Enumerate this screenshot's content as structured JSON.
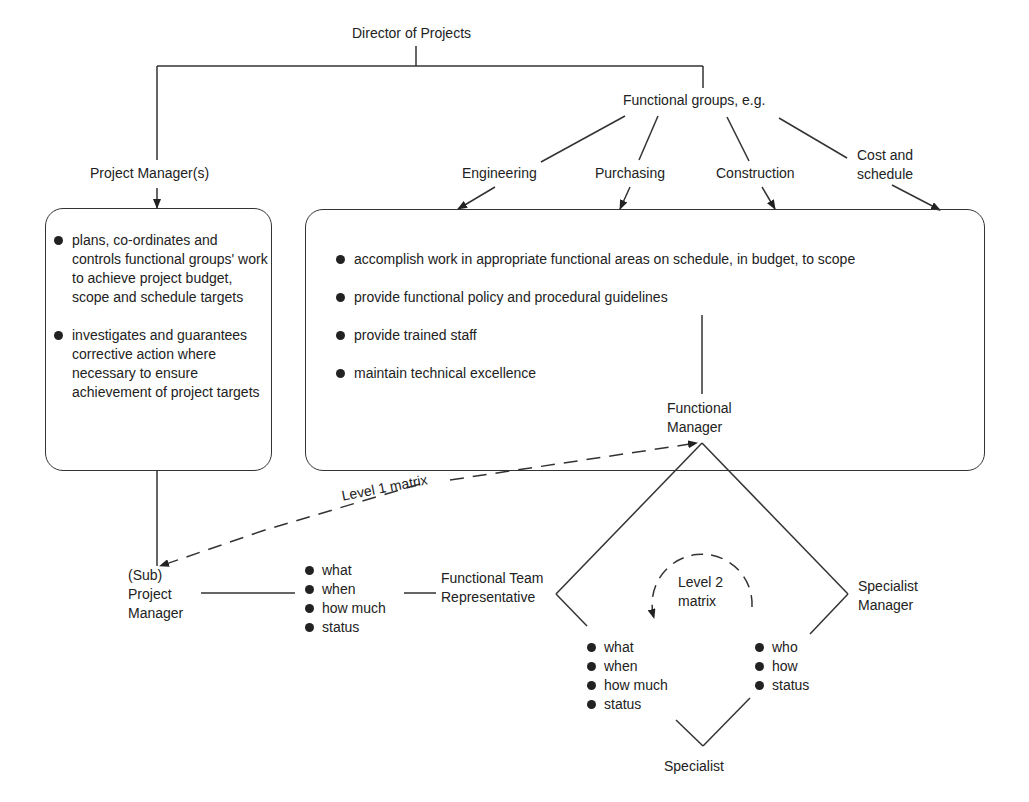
{
  "nodes": {
    "director": "Director of Projects",
    "project_managers": "Project Manager(s)",
    "functional_groups": "Functional groups, e.g.",
    "groups": [
      "Engineering",
      "Purchasing",
      "Construction",
      "Cost and schedule"
    ],
    "functional_manager": "Functional Manager",
    "sub_project_manager": "(Sub) Project Manager",
    "functional_team_rep": "Functional Team Representative",
    "specialist_manager": "Specialist Manager",
    "specialist": "Specialist"
  },
  "pm_box": {
    "items": [
      "plans, co-ordinates and controls functional groups' work to achieve project budget, scope and schedule targets",
      "investigates and guarantees corrective action where necessary to ensure achievement of project targets"
    ]
  },
  "fg_box": {
    "items": [
      "accomplish work in appropriate functional areas on schedule, in budget, to scope",
      "provide functional policy and procedural guidelines",
      "provide trained staff",
      "maintain technical excellence"
    ]
  },
  "matrix_labels": {
    "level1": "Level 1 matrix",
    "level2_line1": "Level 2",
    "level2_line2": "matrix"
  },
  "lists": {
    "pm_to_rep": [
      "what",
      "when",
      "how much",
      "status"
    ],
    "rep_to_specialist": [
      "what",
      "when",
      "how much",
      "status"
    ],
    "spec_mgr_to_specialist": [
      "who",
      "how",
      "status"
    ]
  }
}
